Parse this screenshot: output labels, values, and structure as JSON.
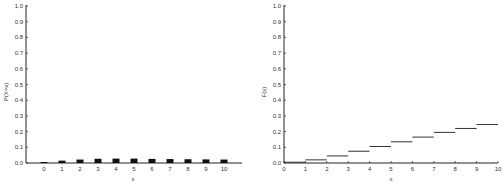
{
  "chart_data": [
    {
      "type": "bar",
      "title": "",
      "xlabel": "x",
      "ylabel": "P(X=x)",
      "categories": [
        "0",
        "1",
        "2",
        "3",
        "4",
        "5",
        "6",
        "7",
        "8",
        "9",
        "10"
      ],
      "values": [
        0.005,
        0.015,
        0.022,
        0.027,
        0.028,
        0.028,
        0.026,
        0.025,
        0.024,
        0.023,
        0.022
      ],
      "ylim": [
        0,
        1.0
      ],
      "yticks": [
        "0.0",
        "0.1",
        "0.2",
        "0.3",
        "0.4",
        "0.5",
        "0.6",
        "0.7",
        "0.8",
        "0.9",
        "1.0"
      ],
      "grid": false,
      "bar_color": "#111111"
    },
    {
      "type": "line",
      "subtype": "step",
      "title": "",
      "xlabel": "x",
      "ylabel": "F(x)",
      "x": [
        0,
        1,
        2,
        3,
        4,
        5,
        6,
        7,
        8,
        9,
        10
      ],
      "values": [
        0.005,
        0.02,
        0.045,
        0.075,
        0.105,
        0.135,
        0.165,
        0.195,
        0.22,
        0.245
      ],
      "xlim": [
        0,
        10
      ],
      "ylim": [
        0,
        1.0
      ],
      "xticks": [
        "0",
        "1",
        "2",
        "3",
        "4",
        "5",
        "6",
        "7",
        "8",
        "9",
        "10"
      ],
      "yticks": [
        "0.0",
        "0.1",
        "0.2",
        "0.3",
        "0.4",
        "0.5",
        "0.6",
        "0.7",
        "0.8",
        "0.9",
        "1.0"
      ],
      "grid": false,
      "line_color": "#333333"
    }
  ]
}
